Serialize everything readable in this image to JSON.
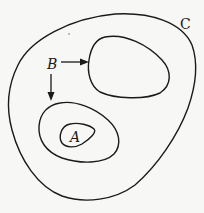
{
  "diagram": {
    "type": "nested-regions",
    "background": "#f7f7f5",
    "stroke_color": "#1a1a1a",
    "regions": [
      {
        "id": "C",
        "label": "C",
        "description": "outer region enclosing all others"
      },
      {
        "id": "B-upper",
        "label": "",
        "description": "upper-right region pointed to by B"
      },
      {
        "id": "B-lower",
        "label": "",
        "description": "lower-left region pointed to by B, contains A"
      },
      {
        "id": "A",
        "label": "A",
        "description": "innermost region inside lower-left region"
      }
    ],
    "labels": {
      "a": "A",
      "b": "B",
      "c": "C"
    },
    "arrows": [
      {
        "from": "B",
        "to": "B-upper",
        "direction": "right"
      },
      {
        "from": "B",
        "to": "B-lower",
        "direction": "down"
      }
    ]
  }
}
